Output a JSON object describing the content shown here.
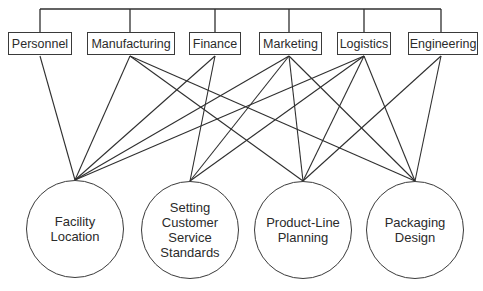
{
  "diagram": {
    "colors": {
      "line": "#2f2f2f",
      "text": "#2b2b2b",
      "background": "#ffffff"
    },
    "functions": [
      {
        "id": "personnel",
        "label": "Personnel",
        "x": 8,
        "w": 64,
        "anchor_x": 40
      },
      {
        "id": "manufacturing",
        "label": "Manufacturing",
        "x": 87,
        "w": 88,
        "anchor_x": 130
      },
      {
        "id": "finance",
        "label": "Finance",
        "x": 189,
        "w": 52,
        "anchor_x": 215
      },
      {
        "id": "marketing",
        "label": "Marketing",
        "x": 259,
        "w": 63,
        "anchor_x": 289
      },
      {
        "id": "logistics",
        "label": "Logistics",
        "x": 337,
        "w": 54,
        "anchor_x": 364
      },
      {
        "id": "engineering",
        "label": "Engineering",
        "x": 408,
        "w": 70,
        "anchor_x": 441
      }
    ],
    "decisions": [
      {
        "id": "facility-location",
        "lines": [
          "Facility",
          "Location"
        ],
        "cx": 75,
        "top": 180
      },
      {
        "id": "customer-service-standards",
        "lines": [
          "Setting",
          "Customer",
          "Service",
          "Standards"
        ],
        "cx": 190,
        "top": 181
      },
      {
        "id": "product-line-planning",
        "lines": [
          "Product-Line",
          "Planning"
        ],
        "cx": 303,
        "top": 181
      },
      {
        "id": "packaging-design",
        "lines": [
          "Packaging",
          "Design"
        ],
        "cx": 415,
        "top": 181
      }
    ],
    "connections": [
      [
        "personnel",
        "facility-location"
      ],
      [
        "manufacturing",
        "facility-location"
      ],
      [
        "manufacturing",
        "product-line-planning"
      ],
      [
        "manufacturing",
        "packaging-design"
      ],
      [
        "finance",
        "facility-location"
      ],
      [
        "finance",
        "customer-service-standards"
      ],
      [
        "marketing",
        "facility-location"
      ],
      [
        "marketing",
        "customer-service-standards"
      ],
      [
        "marketing",
        "product-line-planning"
      ],
      [
        "marketing",
        "packaging-design"
      ],
      [
        "logistics",
        "facility-location"
      ],
      [
        "logistics",
        "customer-service-standards"
      ],
      [
        "logistics",
        "product-line-planning"
      ],
      [
        "logistics",
        "packaging-design"
      ],
      [
        "engineering",
        "product-line-planning"
      ],
      [
        "engineering",
        "packaging-design"
      ]
    ],
    "bus": {
      "y": 9,
      "box_top": 32,
      "box_bottom": 56
    }
  }
}
